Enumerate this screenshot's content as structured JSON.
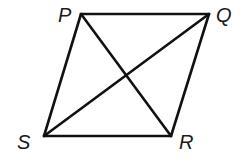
{
  "figure": {
    "type": "parallelogram-with-diagonals",
    "vertices": [
      {
        "label": "P",
        "x": 81,
        "y": 14,
        "lx": 58,
        "ly": 22
      },
      {
        "label": "Q",
        "x": 209,
        "y": 14,
        "lx": 216,
        "ly": 22
      },
      {
        "label": "R",
        "x": 171,
        "y": 136,
        "lx": 179,
        "ly": 149
      },
      {
        "label": "S",
        "x": 44,
        "y": 136,
        "lx": 17,
        "ly": 149
      }
    ],
    "sides": [
      "PQ",
      "QR",
      "RS",
      "SP"
    ],
    "diagonals": [
      "PR",
      "QS"
    ],
    "stroke_color": "#111111"
  }
}
